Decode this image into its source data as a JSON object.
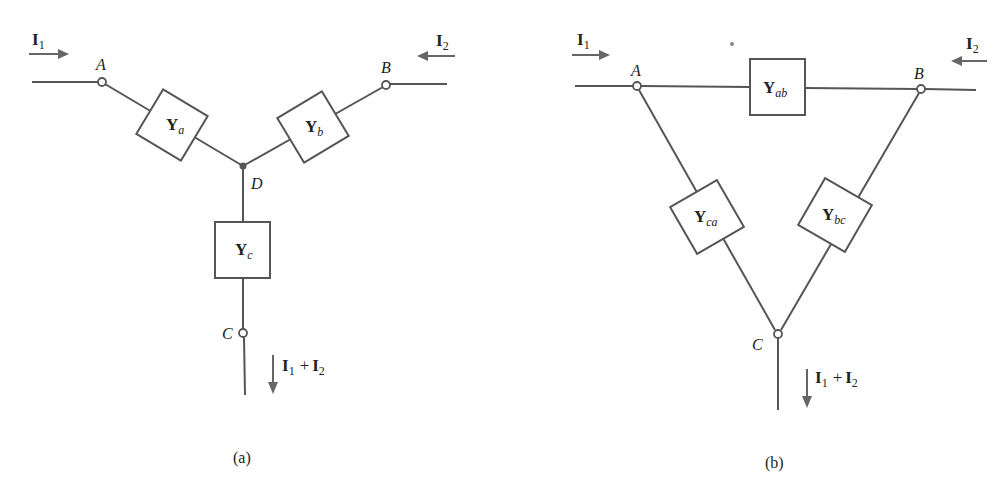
{
  "diagram_a": {
    "caption": "(a)",
    "type": "Y (wye) network",
    "current_in_left": {
      "symbol": "I",
      "sub": "1"
    },
    "current_in_right": {
      "symbol": "I",
      "sub": "2"
    },
    "current_out": {
      "term1": "I",
      "sub1": "1",
      "plus": "+",
      "term2": "I",
      "sub2": "2"
    },
    "nodes": {
      "A": "A",
      "B": "B",
      "C": "C",
      "D": "D"
    },
    "elements": [
      {
        "symbol": "Y",
        "sub": "a",
        "between": [
          "A",
          "D"
        ]
      },
      {
        "symbol": "Y",
        "sub": "b",
        "between": [
          "B",
          "D"
        ]
      },
      {
        "symbol": "Y",
        "sub": "c",
        "between": [
          "D",
          "C"
        ]
      }
    ]
  },
  "diagram_b": {
    "caption": "(b)",
    "type": "Delta network",
    "current_in_left": {
      "symbol": "I",
      "sub": "1"
    },
    "current_in_right": {
      "symbol": "I",
      "sub": "2"
    },
    "current_out": {
      "term1": "I",
      "sub1": "1",
      "plus": "+",
      "term2": "I",
      "sub2": "2"
    },
    "nodes": {
      "A": "A",
      "B": "B",
      "C": "C"
    },
    "elements": [
      {
        "symbol": "Y",
        "sub": "ab",
        "between": [
          "A",
          "B"
        ]
      },
      {
        "symbol": "Y",
        "sub": "ca",
        "between": [
          "C",
          "A"
        ]
      },
      {
        "symbol": "Y",
        "sub": "bc",
        "between": [
          "B",
          "C"
        ]
      }
    ]
  }
}
